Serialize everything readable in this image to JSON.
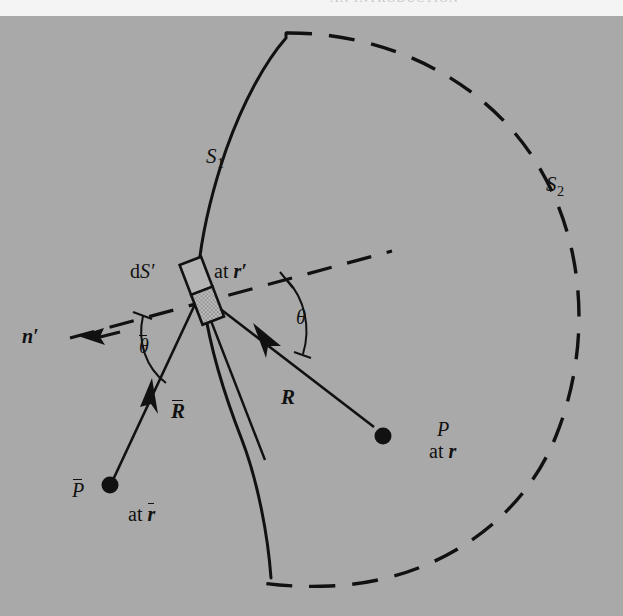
{
  "figure": {
    "header_clipped_text": "AN INTRODUCTION",
    "background_color": "#a9a9a9",
    "ink_color": "#111111",
    "plate_width": 623,
    "plate_height": 600
  },
  "labels": {
    "surface_s1": "S",
    "surface_s1_sub": "1",
    "surface_s2": "S",
    "surface_s2_sub": "2",
    "area_element": "d",
    "area_element_italic": "S′",
    "area_element_position": "at",
    "area_element_position_vec": "r′",
    "normal": "n′",
    "angle_theta": "θ",
    "angle_theta_bar": "θ",
    "vector_r": "R",
    "vector_r_bar": "R",
    "point_p": "P",
    "point_p_position": "at",
    "point_p_position_vec": "r",
    "point_p_bar": "P",
    "point_p_bar_position": "at",
    "point_p_bar_position_vec": "r"
  },
  "geometry": {
    "element_center": {
      "x": 201,
      "y": 274
    },
    "point_p": {
      "x": 383,
      "y": 420
    },
    "point_p_bar": {
      "x": 106,
      "y": 473
    },
    "surface_s1_type": "solid-curve",
    "surface_s2_type": "dashed-arc",
    "normal_line_type": "dashed"
  }
}
